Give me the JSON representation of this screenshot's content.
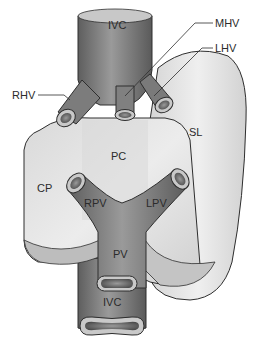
{
  "figure": {
    "type": "anatomical-diagram",
    "labels": {
      "ivc_top": "IVC",
      "mhv": "MHV",
      "lhv": "LHV",
      "rhv": "RHV",
      "sl": "SL",
      "pc": "PC",
      "cp": "CP",
      "rpv": "RPV",
      "lpv": "LPV",
      "pv": "PV",
      "ivc_bottom": "IVC"
    },
    "colors": {
      "background": "#ffffff",
      "liver_light": "#e9e9e9",
      "liver_mid": "#d2d2d2",
      "liver_shadow": "#b5b5b5",
      "vessel_dark": "#6a6a6a",
      "vessel_mid": "#8c8c8c",
      "vessel_light": "#a8a8a8",
      "outline": "#2e2e2e",
      "label_text": "#2b2b2b"
    }
  }
}
